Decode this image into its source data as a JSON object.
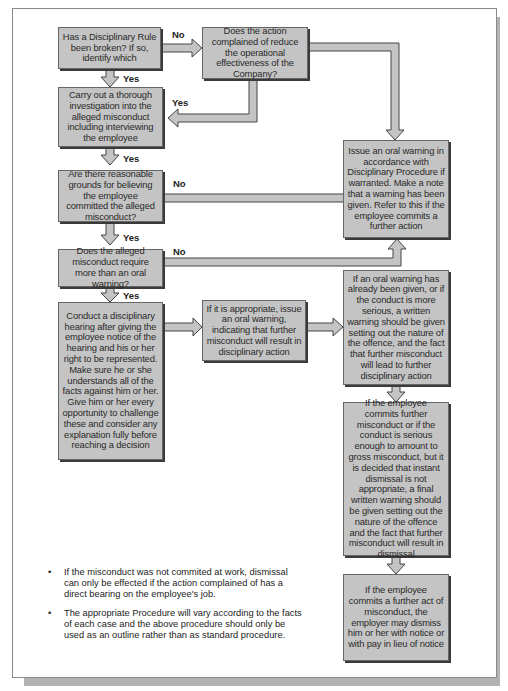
{
  "flowchart": {
    "boxes": {
      "rule_broken": "Has a Disciplinary Rule been broken? If so, identify which",
      "reduce_effectiveness": "Does the action complained of reduce the operational effectiveness of the Company?",
      "investigate": "Carry out a thorough investigation into the alleged misconduct including interviewing the employee",
      "reasonable_grounds": "Are there reasonable grounds for believing the employee committed the alleged misconduct?",
      "more_than_oral": "Does the alleged misconduct require more than an oral warning?",
      "oral_warning_note": "Issue an oral warning in accordance with Disciplinary Procedure if warranted. Make a note that a warning has been given. Refer to this if the employee commits a further action",
      "hearing": "Conduct a disciplinary hearing after giving the employee notice of the hearing and his or her right to be represented. Make sure he or she understands all of the facts against him or her. Give him or her every opportunity to challenge these and consider any explanation fully before reaching a decision",
      "issue_oral_if_appropriate": "If it is appropriate, issue an oral warning, indicating that further misconduct will result in disciplinary action",
      "written_warning": "If an oral warning has already been given, or if the conduct is more serious, a written warning should be given setting out the nature of the offence, and the fact that further misconduct will lead to further disciplinary action",
      "final_written_warning": "If the employee commits further misconduct or if the conduct is serious enough to amount to gross misconduct, but it is decided that instant dismissal is not appropriate, a final written warning should be given setting out the nature of the offence and the fact that further misconduct will result in dismissal",
      "dismiss": "If the employee commits a further act of misconduct, the employer may dismiss him or her with notice or with pay in lieu of notice"
    },
    "labels": {
      "no1": "No",
      "yes1": "Yes",
      "yes2": "Yes",
      "yes3": "Yes",
      "no2": "No",
      "yes4": "Yes",
      "no3": "No",
      "yes5": "Yes"
    },
    "colors": {
      "box_fill": "#c4c4c4",
      "arrow_fill": "#c4c4c4",
      "outline": "#555555",
      "shadow": "#b3b3b3"
    }
  },
  "notes": [
    "If the misconduct was not commited at work, dismissal can only be effected if the action complained of has a direct bearing on the employee's job.",
    "The appropriate Procedure will vary according to the facts of each case and the above procedure should only be used as an outline rather than as standard procedure."
  ],
  "bullet": "•"
}
